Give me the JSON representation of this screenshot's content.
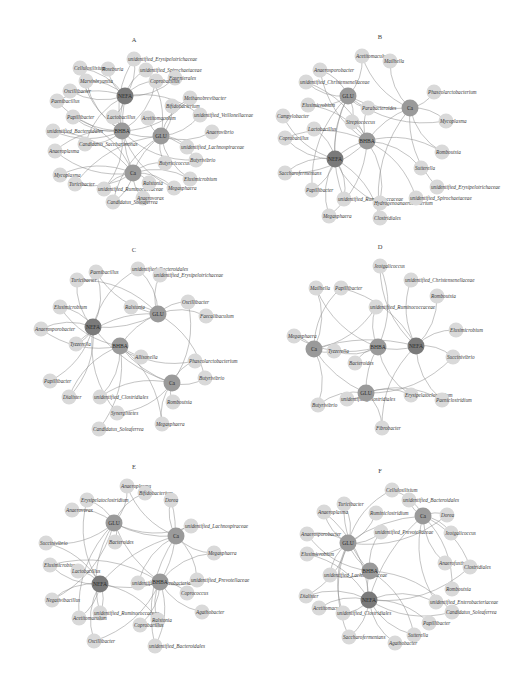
{
  "figure": {
    "type": "correlation-network",
    "panels": [
      {
        "id": "A",
        "title": "A",
        "cx": 132,
        "cy": 97,
        "hubs": [
          {
            "id": "NEFA",
            "x": 125,
            "y": 96,
            "shade": "hub"
          },
          {
            "id": "BHBA",
            "x": 122,
            "y": 131,
            "shade": "met"
          },
          {
            "id": "GLU",
            "x": 161,
            "y": 136,
            "shade": "met"
          },
          {
            "id": "Ca",
            "x": 133,
            "y": 173,
            "shade": "met"
          }
        ],
        "leaves": [
          {
            "label": "unidentified_Erysipelotrichaceae",
            "x": 134,
            "y": 59
          },
          {
            "label": "Roseburia",
            "x": 108,
            "y": 69
          },
          {
            "label": "Cellulosilisium",
            "x": 80,
            "y": 68
          },
          {
            "label": "unidentified_Spirochaetaceae",
            "x": 146,
            "y": 70
          },
          {
            "label": "Fournierales",
            "x": 175,
            "y": 78
          },
          {
            "label": "Coprobacillus",
            "x": 156,
            "y": 81
          },
          {
            "label": "Marvinbryantia",
            "x": 86,
            "y": 81
          },
          {
            "label": "Oscillibacter",
            "x": 70,
            "y": 91
          },
          {
            "label": "Paenibacillus",
            "x": 57,
            "y": 101
          },
          {
            "label": "Methanobrevibacter",
            "x": 190,
            "y": 98
          },
          {
            "label": "Bifidobacterium",
            "x": 172,
            "y": 106
          },
          {
            "label": "Papillibacter",
            "x": 73,
            "y": 117
          },
          {
            "label": "Lactobacillus",
            "x": 113,
            "y": 117
          },
          {
            "label": "Acetitomaculum",
            "x": 148,
            "y": 118
          },
          {
            "label": "unidentified_Veillonellaceae",
            "x": 200,
            "y": 115
          },
          {
            "label": "unidentified_Bacteroidales",
            "x": 53,
            "y": 131
          },
          {
            "label": "Anaerovibrio",
            "x": 212,
            "y": 132
          },
          {
            "label": "Candidatus_Saccharimonas",
            "x": 85,
            "y": 144
          },
          {
            "label": "Anaeroplasma",
            "x": 55,
            "y": 151
          },
          {
            "label": "unidentified_Lachnospiraceae",
            "x": 187,
            "y": 147
          },
          {
            "label": "Butyricicoccus",
            "x": 165,
            "y": 163
          },
          {
            "label": "Butyrivibrio",
            "x": 196,
            "y": 160
          },
          {
            "label": "Mycoplasma",
            "x": 60,
            "y": 175
          },
          {
            "label": "Turicibacter",
            "x": 75,
            "y": 184
          },
          {
            "label": "unidentified_Ruminococcaceae",
            "x": 104,
            "y": 189
          },
          {
            "label": "Ralstonia",
            "x": 149,
            "y": 183
          },
          {
            "label": "Elusimicrobium",
            "x": 190,
            "y": 179
          },
          {
            "label": "Megasphaera",
            "x": 174,
            "y": 188
          },
          {
            "label": "Anaerovorax",
            "x": 143,
            "y": 198
          },
          {
            "label": "Candidatus_Soleaferrea",
            "x": 113,
            "y": 202
          }
        ]
      },
      {
        "id": "B",
        "title": "B",
        "cx": 378,
        "cy": 97,
        "hubs": [
          {
            "id": "GLU",
            "x": 348,
            "y": 96,
            "shade": "met"
          },
          {
            "id": "Ca",
            "x": 410,
            "y": 108,
            "shade": "met"
          },
          {
            "id": "BHBA",
            "x": 367,
            "y": 141,
            "shade": "met"
          },
          {
            "id": "NEFA",
            "x": 335,
            "y": 159,
            "shade": "hub"
          }
        ],
        "leaves": [
          {
            "label": "Acetitomaculum",
            "x": 362,
            "y": 56
          },
          {
            "label": "Mailhella",
            "x": 390,
            "y": 61
          },
          {
            "label": "Anaerosporobacter",
            "x": 320,
            "y": 70
          },
          {
            "label": "unidentified_Christensenellaceae",
            "x": 306,
            "y": 82
          },
          {
            "label": "Phascolarctobacterium",
            "x": 434,
            "y": 92
          },
          {
            "label": "Elusimicrobium",
            "x": 308,
            "y": 105
          },
          {
            "label": "Parabacteroides",
            "x": 368,
            "y": 108
          },
          {
            "label": "Campylobacter",
            "x": 283,
            "y": 116
          },
          {
            "label": "Streptococcus",
            "x": 352,
            "y": 122
          },
          {
            "label": "Mycoplasma",
            "x": 446,
            "y": 121
          },
          {
            "label": "Lactobacillus",
            "x": 314,
            "y": 129
          },
          {
            "label": "Coprobacillus",
            "x": 285,
            "y": 138
          },
          {
            "label": "Romboutsia",
            "x": 442,
            "y": 152
          },
          {
            "label": "Sutterella",
            "x": 421,
            "y": 168
          },
          {
            "label": "Saccharofermentans",
            "x": 285,
            "y": 173
          },
          {
            "label": "Papillibacter",
            "x": 312,
            "y": 190
          },
          {
            "label": "unidentified_Erysipelotrichaceae",
            "x": 437,
            "y": 187
          },
          {
            "label": "unidentified_Ruminococcaceae",
            "x": 344,
            "y": 199
          },
          {
            "label": "Hydrogenoanaerobacterium",
            "x": 380,
            "y": 203
          },
          {
            "label": "unidentified_Spirochaetaceae",
            "x": 416,
            "y": 198
          },
          {
            "label": "Megasphaera",
            "x": 329,
            "y": 216
          },
          {
            "label": "Clostridiales",
            "x": 380,
            "y": 218
          }
        ]
      },
      {
        "id": "C",
        "title": "C",
        "cx": 132,
        "cy": 326,
        "hubs": [
          {
            "id": "NEFA",
            "x": 93,
            "y": 327,
            "shade": "hub"
          },
          {
            "id": "GLU",
            "x": 158,
            "y": 314,
            "shade": "met"
          },
          {
            "id": "BHBA",
            "x": 120,
            "y": 346,
            "shade": "met"
          },
          {
            "id": "Ca",
            "x": 172,
            "y": 383,
            "shade": "met"
          }
        ],
        "leaves": [
          {
            "label": "unidentified_Bacteroidales",
            "x": 138,
            "y": 269
          },
          {
            "label": "unidentified_Erysipelotrichaceae",
            "x": 160,
            "y": 275
          },
          {
            "label": "Paenibacillus",
            "x": 96,
            "y": 272
          },
          {
            "label": "Turicibacter",
            "x": 77,
            "y": 280
          },
          {
            "label": "Ralstonia",
            "x": 131,
            "y": 307
          },
          {
            "label": "Oscillibacter",
            "x": 188,
            "y": 302
          },
          {
            "label": "Elusimicrobium",
            "x": 60,
            "y": 307
          },
          {
            "label": "Faecalibaculum",
            "x": 206,
            "y": 316
          },
          {
            "label": "Anaerosporobacter",
            "x": 41,
            "y": 329
          },
          {
            "label": "Tyzzerella",
            "x": 76,
            "y": 344
          },
          {
            "label": "Allisonella",
            "x": 141,
            "y": 357
          },
          {
            "label": "Phascolarctobacterium",
            "x": 195,
            "y": 361
          },
          {
            "label": "Butyrivibrio",
            "x": 205,
            "y": 378
          },
          {
            "label": "Papillibacter",
            "x": 50,
            "y": 381
          },
          {
            "label": "Dialister",
            "x": 69,
            "y": 397
          },
          {
            "label": "unidentified_Clostridiales",
            "x": 100,
            "y": 397
          },
          {
            "label": "Romboutsia",
            "x": 173,
            "y": 402
          },
          {
            "label": "Synergistetes",
            "x": 117,
            "y": 413
          },
          {
            "label": "Megasphaera",
            "x": 162,
            "y": 424
          },
          {
            "label": "Candidatus_Soleaferrea",
            "x": 99,
            "y": 429
          }
        ]
      },
      {
        "id": "D",
        "title": "D",
        "cx": 378,
        "cy": 326,
        "hubs": [
          {
            "id": "BHBA",
            "x": 378,
            "y": 347,
            "shade": "met"
          },
          {
            "id": "NEFA",
            "x": 416,
            "y": 346,
            "shade": "hub"
          },
          {
            "id": "Ca",
            "x": 314,
            "y": 349,
            "shade": "met"
          },
          {
            "id": "GLU",
            "x": 366,
            "y": 393,
            "shade": "met"
          }
        ],
        "leaves": [
          {
            "label": "Jeotgalicoccus",
            "x": 380,
            "y": 266
          },
          {
            "label": "unidentified_Christensenellaceae",
            "x": 411,
            "y": 280
          },
          {
            "label": "Mailhella",
            "x": 316,
            "y": 288
          },
          {
            "label": "Papillibacter",
            "x": 341,
            "y": 288
          },
          {
            "label": "Romboutsia",
            "x": 437,
            "y": 296
          },
          {
            "label": "unidentified_Ruminococcaceae",
            "x": 376,
            "y": 307
          },
          {
            "label": "Megasphaera",
            "x": 294,
            "y": 336
          },
          {
            "label": "Elusimicrobium",
            "x": 456,
            "y": 330
          },
          {
            "label": "Tyzzerella",
            "x": 334,
            "y": 351
          },
          {
            "label": "Succinivibrio",
            "x": 453,
            "y": 357
          },
          {
            "label": "Bacteroides",
            "x": 355,
            "y": 363
          },
          {
            "label": "Erysipelatoclostridium",
            "x": 411,
            "y": 395
          },
          {
            "label": "Paeniclostridium",
            "x": 442,
            "y": 400
          },
          {
            "label": "unidentified_Clostridiales",
            "x": 347,
            "y": 399
          },
          {
            "label": "Butyrivibrio",
            "x": 318,
            "y": 405
          },
          {
            "label": "Fibrobacter",
            "x": 382,
            "y": 428
          }
        ]
      },
      {
        "id": "E",
        "title": "E",
        "cx": 132,
        "cy": 558,
        "hubs": [
          {
            "id": "GLU",
            "x": 114,
            "y": 523,
            "shade": "met"
          },
          {
            "id": "Ca",
            "x": 176,
            "y": 536,
            "shade": "met"
          },
          {
            "id": "NEFA",
            "x": 100,
            "y": 584,
            "shade": "hub"
          },
          {
            "id": "BHBA",
            "x": 160,
            "y": 582,
            "shade": "met"
          }
        ],
        "leaves": [
          {
            "label": "Anaeroplasma",
            "x": 127,
            "y": 486
          },
          {
            "label": "Bifidobacterium",
            "x": 145,
            "y": 493
          },
          {
            "label": "Erysipelatoclostridium",
            "x": 87,
            "y": 500
          },
          {
            "label": "Dorea",
            "x": 171,
            "y": 500
          },
          {
            "label": "Anaerovorax",
            "x": 72,
            "y": 510
          },
          {
            "label": "unidentified_Lachnospiraceae",
            "x": 191,
            "y": 526
          },
          {
            "label": "Succinivibrio",
            "x": 46,
            "y": 543
          },
          {
            "label": "Bacteroides",
            "x": 115,
            "y": 542
          },
          {
            "label": "Megasphaera",
            "x": 214,
            "y": 553
          },
          {
            "label": "Elusimicrobium",
            "x": 50,
            "y": 565
          },
          {
            "label": "Lactobacillus",
            "x": 78,
            "y": 571
          },
          {
            "label": "unidentified_Enterobacteriaceae",
            "x": 138,
            "y": 583
          },
          {
            "label": "unidentified_Prevotellaceae",
            "x": 197,
            "y": 580
          },
          {
            "label": "Coprococcus",
            "x": 187,
            "y": 593
          },
          {
            "label": "Negativibacillus",
            "x": 52,
            "y": 600
          },
          {
            "label": "unidentified_Ruminococcaceae",
            "x": 100,
            "y": 613
          },
          {
            "label": "Agathobacter",
            "x": 202,
            "y": 612
          },
          {
            "label": "Acetitomaculum",
            "x": 79,
            "y": 618
          },
          {
            "label": "Ralstonia",
            "x": 158,
            "y": 620
          },
          {
            "label": "Coprobacillus",
            "x": 140,
            "y": 625
          },
          {
            "label": "Oscillibacter",
            "x": 94,
            "y": 641
          },
          {
            "label": "unidentified_Bacteroidales",
            "x": 155,
            "y": 646
          }
        ]
      },
      {
        "id": "F",
        "title": "F",
        "cx": 378,
        "cy": 558,
        "hubs": [
          {
            "id": "Ca",
            "x": 423,
            "y": 516,
            "shade": "met"
          },
          {
            "id": "GLU",
            "x": 348,
            "y": 543,
            "shade": "met"
          },
          {
            "id": "BHBA",
            "x": 370,
            "y": 571,
            "shade": "met"
          },
          {
            "id": "NEFA",
            "x": 369,
            "y": 600,
            "shade": "hub"
          }
        ],
        "leaves": [
          {
            "label": "Cellulosilisium",
            "x": 392,
            "y": 490
          },
          {
            "label": "unidentified_Bacteroidales",
            "x": 409,
            "y": 500
          },
          {
            "label": "Turicibacter",
            "x": 344,
            "y": 504
          },
          {
            "label": "Anaeroplasma",
            "x": 324,
            "y": 512
          },
          {
            "label": "Ruminiclostridium",
            "x": 376,
            "y": 513
          },
          {
            "label": "Dorea",
            "x": 447,
            "y": 515
          },
          {
            "label": "unidentified_Prevotellaceae",
            "x": 381,
            "y": 532
          },
          {
            "label": "Jeotgalicoccus",
            "x": 451,
            "y": 533
          },
          {
            "label": "Anaerosporobacter",
            "x": 307,
            "y": 534
          },
          {
            "label": "Elusimicrobium",
            "x": 307,
            "y": 554
          },
          {
            "label": "Anaerofustis",
            "x": 445,
            "y": 563
          },
          {
            "label": "Clostridiales",
            "x": 470,
            "y": 567
          },
          {
            "label": "unidentified_Lachnospiraceae",
            "x": 330,
            "y": 575
          },
          {
            "label": "Romboutsia",
            "x": 452,
            "y": 589
          },
          {
            "label": "Dialister",
            "x": 306,
            "y": 596
          },
          {
            "label": "unidentified_Enterobacteriaceae",
            "x": 436,
            "y": 602
          },
          {
            "label": "Acetitomaculum",
            "x": 319,
            "y": 608
          },
          {
            "label": "unidentified_Clostridiales",
            "x": 343,
            "y": 613
          },
          {
            "label": "Candidatus_Soleaferrea",
            "x": 452,
            "y": 612
          },
          {
            "label": "Papillibacter",
            "x": 429,
            "y": 623
          },
          {
            "label": "Sutterella",
            "x": 414,
            "y": 635
          },
          {
            "label": "Saccharofermentans",
            "x": 349,
            "y": 637
          },
          {
            "label": "Agathobacter",
            "x": 395,
            "y": 643
          }
        ]
      }
    ]
  },
  "colors": {
    "leaf_node": "#d9d9d9",
    "metabolite_node": "#9a9a9a",
    "nefa_node": "#7a7a7a",
    "edge": "#8a8a8a",
    "background": "#ffffff"
  }
}
